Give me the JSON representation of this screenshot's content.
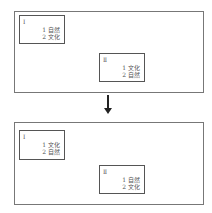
{
  "before": {
    "box1": {
      "label": "Ⅰ",
      "items": [
        "1 自然",
        "2 文化"
      ]
    },
    "box2": {
      "label": "Ⅱ",
      "items": [
        "1 文化",
        "2 自然"
      ]
    }
  },
  "after": {
    "box1": {
      "label": "Ⅰ",
      "items": [
        "1 文化",
        "2 自然"
      ]
    },
    "box2": {
      "label": "Ⅱ",
      "items": [
        "1 自然",
        "2 文化"
      ]
    }
  }
}
